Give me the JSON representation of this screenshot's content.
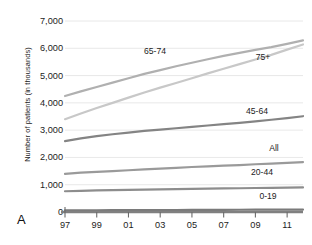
{
  "panel": {
    "letter": "A"
  },
  "chart_data": {
    "type": "line",
    "title": "",
    "xlabel": "",
    "ylabel": "Number of patients (in thousands)",
    "ylim": [
      0,
      7000
    ],
    "yticks": [
      "0",
      "1,000",
      "2,000",
      "3,000",
      "4,000",
      "5,000",
      "6,000",
      "7,000"
    ],
    "ytick_values": [
      0,
      1000,
      2000,
      3000,
      4000,
      5000,
      6000,
      7000
    ],
    "xlim": [
      1997,
      2012
    ],
    "xticks": [
      "97",
      "99",
      "01",
      "03",
      "05",
      "07",
      "09",
      "11"
    ],
    "xtick_values": [
      1997,
      1999,
      2001,
      2003,
      2005,
      2007,
      2009,
      2011
    ],
    "x": [
      1997,
      1998,
      1999,
      2000,
      2001,
      2002,
      2003,
      2004,
      2005,
      2006,
      2007,
      2008,
      2009,
      2010,
      2011,
      2012
    ],
    "grid": true,
    "legend_position": "inline-labels",
    "series": [
      {
        "name": "65-74",
        "label": "65-74",
        "color": "#b0b0b0",
        "values": [
          4250,
          4420,
          4580,
          4740,
          4900,
          5060,
          5200,
          5340,
          5470,
          5600,
          5720,
          5830,
          5940,
          6040,
          6160,
          6290
        ]
      },
      {
        "name": "75+",
        "label": "75+",
        "color": "#c8c8c8",
        "values": [
          3400,
          3610,
          3810,
          4000,
          4190,
          4380,
          4560,
          4730,
          4900,
          5080,
          5250,
          5420,
          5590,
          5760,
          5950,
          6140
        ]
      },
      {
        "name": "45-64",
        "label": "45-64",
        "color": "#848484",
        "values": [
          2600,
          2700,
          2780,
          2850,
          2910,
          2970,
          3020,
          3070,
          3120,
          3170,
          3220,
          3270,
          3320,
          3380,
          3440,
          3510
        ]
      },
      {
        "name": "All",
        "label": "All",
        "color": "#9a9a9a",
        "values": [
          1400,
          1440,
          1470,
          1500,
          1530,
          1560,
          1590,
          1620,
          1650,
          1670,
          1700,
          1720,
          1750,
          1770,
          1800,
          1830
        ]
      },
      {
        "name": "20-44",
        "label": "20-44",
        "color": "#8d8d8d",
        "values": [
          760,
          775,
          790,
          800,
          810,
          820,
          830,
          840,
          850,
          860,
          865,
          870,
          880,
          885,
          890,
          900
        ]
      },
      {
        "name": "0-19",
        "label": "0-19",
        "color": "#7a7a7a",
        "values": [
          60,
          62,
          64,
          66,
          68,
          70,
          72,
          74,
          76,
          78,
          80,
          82,
          84,
          86,
          88,
          90
        ]
      }
    ],
    "series_label_positions": [
      {
        "name": "65-74",
        "x": 155,
        "y": 51
      },
      {
        "name": "75+",
        "x": 263,
        "y": 57
      },
      {
        "name": "45-64",
        "x": 257,
        "y": 111
      },
      {
        "name": "All",
        "x": 274,
        "y": 148
      },
      {
        "name": "20-44",
        "x": 262,
        "y": 172
      },
      {
        "name": "0-19",
        "x": 268,
        "y": 196
      }
    ]
  }
}
